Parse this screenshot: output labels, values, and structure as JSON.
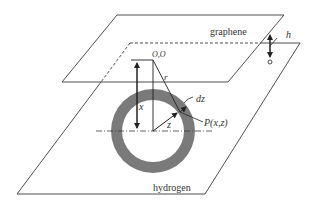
{
  "diagram": {
    "labels": {
      "top_plane": "graphene",
      "bottom_plane": "hydrogen",
      "separation": "h",
      "origin": "O,O",
      "radius": "r",
      "x_distance": "x",
      "z_radius": "z",
      "ring_thickness": "dz",
      "point": "P(x,z)"
    },
    "colors": {
      "line": "#3a3a3a",
      "ring_fill": "#7a7a7a",
      "background": "#ffffff"
    }
  }
}
